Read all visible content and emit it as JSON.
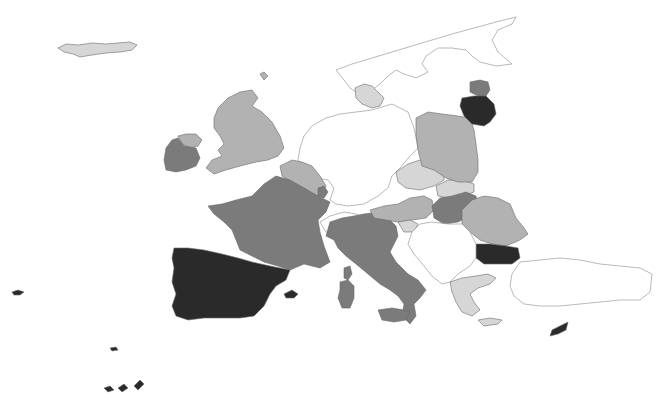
{
  "map": {
    "type": "choropleth",
    "width": 666,
    "height": 405,
    "background": "#ffffff",
    "shade_levels": {
      "none": "#ffffff",
      "very_light": "#d6d6d6",
      "light": "#b2b2b2",
      "mid": "#7b7b7b",
      "dark": "#2a2a2a"
    },
    "regions": [
      {
        "id": "iceland",
        "level": "very_light",
        "points": "58,48 66,44 78,45 92,43 106,44 118,43 130,42 137,45 132,50 120,52 106,53 92,55 80,57 73,54 64,52"
      },
      {
        "id": "norway-sweden-finland",
        "level": "none",
        "points": "336,70 352,64 372,58 392,52 412,46 432,40 452,34 474,28 496,22 516,17 512,24 498,30 492,40 498,52 512,64 496,66 480,62 472,56 466,50 452,48 438,48 426,56 422,64 428,72 416,78 404,74 396,70 388,76 380,84 372,90 362,96 350,88 344,80"
      },
      {
        "id": "denmark",
        "level": "very_light",
        "points": "355,88 364,84 372,86 378,92 384,98 380,106 372,108 362,104 356,98"
      },
      {
        "id": "uk",
        "level": "light",
        "points": "218,108 228,98 240,92 252,90 258,98 252,106 262,112 272,122 280,136 284,148 278,156 268,160 256,162 240,166 226,170 214,174 206,168 212,160 222,156 218,150 224,144 220,136 214,128 214,118"
      },
      {
        "id": "northern-ireland",
        "level": "light",
        "points": "178,136 186,134 196,134 202,140 198,146 190,148 182,144"
      },
      {
        "id": "ireland",
        "level": "mid",
        "points": "166,148 172,140 178,138 184,146 196,148 200,158 196,166 186,170 176,172 166,170 164,160"
      },
      {
        "id": "netherlands-germany",
        "level": "none",
        "points": "298,160 300,148 304,136 312,126 326,118 340,114 356,112 372,110 392,104 408,112 414,128 418,148 410,156 400,168 392,176 388,188 378,196 364,204 348,206 336,204 330,200 334,188 328,180 316,178 306,168"
      },
      {
        "id": "belgium",
        "level": "light",
        "points": "280,166 292,160 302,162 312,166 320,176 326,186 322,194 316,196 304,188 292,182 282,176"
      },
      {
        "id": "luxembourg",
        "level": "mid",
        "points": "318,188 324,186 328,192 324,198 318,196"
      },
      {
        "id": "france",
        "level": "mid",
        "points": "208,206 222,204 236,200 252,196 264,184 276,176 290,180 304,188 318,196 330,202 326,212 318,220 320,232 324,246 330,262 320,268 304,264 290,270 278,266 264,262 252,256 240,250 236,240 232,230 224,222 214,214"
      },
      {
        "id": "switzerland",
        "level": "none",
        "points": "320,222 330,216 344,212 356,214 366,218 362,228 352,232 338,232 326,232"
      },
      {
        "id": "spain-portugal",
        "level": "dark",
        "points": "174,248 188,248 204,250 222,254 238,258 252,262 270,266 290,270 286,280 276,286 270,294 264,306 254,316 240,318 220,318 204,318 188,320 176,316 172,306 176,294 172,282 174,268 172,258"
      },
      {
        "id": "balearic-islands",
        "level": "dark",
        "points": "284,294 292,290 298,294 294,298 286,298"
      },
      {
        "id": "italy",
        "level": "mid",
        "points": "330,222 342,218 354,216 364,214 378,212 388,218 396,226 398,236 394,244 390,252 396,262 408,274 418,280 426,290 420,298 414,304 416,316 410,324 402,316 404,304 398,296 390,290 380,284 368,274 356,264 346,256 338,248 334,240 326,236"
      },
      {
        "id": "sardinia",
        "level": "mid",
        "points": "340,282 348,280 354,286 354,298 350,308 342,308 338,298 340,290"
      },
      {
        "id": "corsica",
        "level": "mid",
        "points": "344,268 350,266 352,274 348,280 344,278"
      },
      {
        "id": "sicily",
        "level": "mid",
        "points": "378,310 392,308 404,310 410,312 406,320 394,322 382,320"
      },
      {
        "id": "austria",
        "level": "light",
        "points": "370,210 384,206 398,204 410,198 424,196 432,200 434,210 426,218 412,220 398,222 386,220 374,218"
      },
      {
        "id": "slovenia",
        "level": "very_light",
        "points": "398,222 410,220 418,224 414,232 404,232"
      },
      {
        "id": "czech-republic",
        "level": "very_light",
        "points": "396,172 408,164 420,160 432,164 444,172 444,180 434,186 420,190 406,188 398,182"
      },
      {
        "id": "slovakia",
        "level": "very_light",
        "points": "436,186 448,180 462,180 474,184 474,192 462,196 448,198 438,196"
      },
      {
        "id": "poland",
        "level": "light",
        "points": "416,118 428,112 442,114 458,116 470,118 474,130 476,144 478,160 478,172 472,182 458,182 446,178 434,170 422,166 418,150 416,134"
      },
      {
        "id": "hungary",
        "level": "mid",
        "points": "432,206 440,198 452,196 466,192 476,196 478,206 470,216 458,222 444,224 434,218"
      },
      {
        "id": "romania",
        "level": "light",
        "points": "462,210 472,200 484,196 498,198 510,204 516,218 524,228 528,234 520,240 506,246 492,244 480,240 470,232 462,224"
      },
      {
        "id": "bulgaria",
        "level": "dark",
        "points": "476,244 490,244 506,246 518,248 520,258 512,264 496,264 484,264 476,258"
      },
      {
        "id": "balkans-croatia-serbia",
        "level": "none",
        "points": "420,224 432,222 448,224 462,224 470,232 476,244 476,258 470,266 458,274 450,282 442,284 432,276 424,266 414,254 408,244 412,232"
      },
      {
        "id": "greece",
        "level": "very_light",
        "points": "450,282 462,278 476,276 488,274 496,278 490,284 478,288 470,294 474,302 480,310 472,316 462,312 456,302 452,292"
      },
      {
        "id": "crete",
        "level": "very_light",
        "points": "478,320 490,318 502,320 498,324 484,326"
      },
      {
        "id": "turkey",
        "level": "none",
        "points": "520,262 540,260 560,258 580,260 600,264 620,266 640,268 652,274 650,292 640,300 620,300 600,302 580,304 560,306 540,306 524,304 514,296 510,286 512,274"
      },
      {
        "id": "cyprus",
        "level": "dark",
        "points": "552,330 560,326 568,322 566,330 558,334 550,336"
      },
      {
        "id": "estonia",
        "level": "mid",
        "points": "470,82 480,80 488,82 490,90 486,96 478,96 470,92"
      },
      {
        "id": "latvia-lithuania",
        "level": "dark",
        "points": "462,98 474,96 486,96 494,104 496,114 490,122 484,126 472,124 464,116 460,106"
      },
      {
        "id": "azores",
        "level": "dark",
        "points": "12,292 18,290 24,292 20,295 14,295"
      },
      {
        "id": "madeira",
        "level": "dark",
        "points": "110,348 116,347 118,350 112,351"
      },
      {
        "id": "canary-islands",
        "level": "dark",
        "points": "104,388 110,386 114,390 108,392"
      },
      {
        "id": "canary-islands-2",
        "level": "dark",
        "points": "118,388 124,384 128,388 122,392"
      },
      {
        "id": "canary-islands-3",
        "level": "dark",
        "points": "134,386 140,380 144,384 138,390"
      },
      {
        "id": "faroe-islands",
        "level": "light",
        "points": "260,74 264,72 268,76 264,80"
      }
    ]
  }
}
